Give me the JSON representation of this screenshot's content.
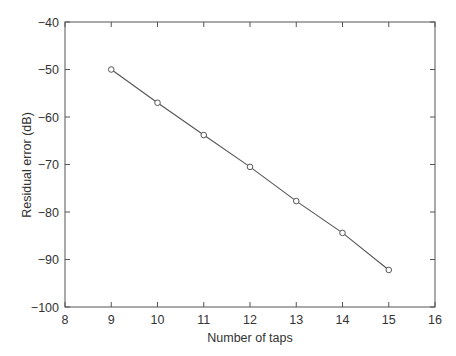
{
  "chart_data": {
    "type": "line",
    "title": "",
    "xlabel": "Number of taps",
    "ylabel": "Residual error (dB)",
    "xlim": [
      8,
      16
    ],
    "ylim": [
      -100,
      -40
    ],
    "xticks": [
      8,
      9,
      10,
      11,
      12,
      13,
      14,
      15,
      16
    ],
    "yticks": [
      -40,
      -50,
      -60,
      -70,
      -80,
      -90,
      -100
    ],
    "xtick_labels": [
      "8",
      "9",
      "10",
      "11",
      "12",
      "13",
      "14",
      "15",
      "16"
    ],
    "ytick_labels": [
      "−40",
      "−50",
      "−60",
      "−70",
      "−80",
      "−90",
      "−100"
    ],
    "grid": false,
    "legend": null,
    "series": [
      {
        "name": "Residual error",
        "marker": "circle-open",
        "color": "#555555",
        "x": [
          9,
          10,
          11,
          12,
          13,
          14,
          15
        ],
        "y": [
          -50.0,
          -57.0,
          -63.8,
          -70.5,
          -77.7,
          -84.4,
          -92.2
        ]
      }
    ]
  },
  "colors": {
    "axis": "#555555",
    "line": "#555555",
    "text": "#333333"
  }
}
